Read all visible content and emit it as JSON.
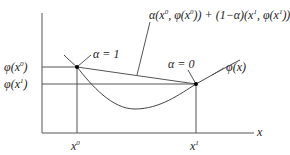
{
  "diagram": {
    "type": "convexity-illustration",
    "axes": {
      "x_label": "x",
      "x_ticks": [
        {
          "label": "x",
          "sup": "0"
        },
        {
          "label": "x",
          "sup": "1"
        }
      ],
      "y_ticks": [
        {
          "label": "φ(x",
          "sup": "0",
          "close": ")"
        },
        {
          "label": "φ(x",
          "sup": "1",
          "close": ")"
        }
      ]
    },
    "annotations": {
      "alpha_one": "α = 1",
      "alpha_zero": "α = 0",
      "curve_label": "φ(x)",
      "chord_label": {
        "p1": "α(x",
        "s1": "0",
        "p2": ", φ(x",
        "s2": "0",
        "p3": ")) + (1−α)(x",
        "s3": "1",
        "p4": ", φ(x",
        "s4": "1",
        "p5": "))"
      }
    },
    "points": [
      {
        "name": "P0",
        "x": 77,
        "y": 67
      },
      {
        "name": "P1",
        "x": 196,
        "y": 84
      }
    ],
    "colors": {
      "line": "#555555",
      "text": "#222222",
      "point": "#000000"
    }
  }
}
